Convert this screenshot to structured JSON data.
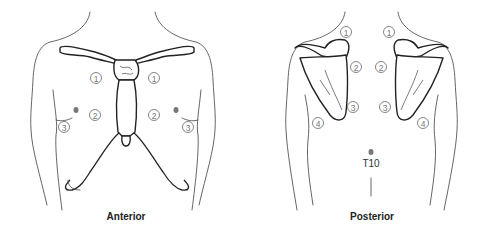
{
  "figure": {
    "panels": [
      {
        "id": "anterior",
        "caption": "Anterior",
        "markers": [
          {
            "label": "1",
            "x": 96,
            "y": 78
          },
          {
            "label": "1",
            "x": 154,
            "y": 78
          },
          {
            "label": "2",
            "x": 95,
            "y": 115
          },
          {
            "label": "2",
            "x": 154,
            "y": 115
          },
          {
            "label": "3",
            "x": 64,
            "y": 127
          },
          {
            "label": "3",
            "x": 188,
            "y": 127
          }
        ],
        "dots": [
          {
            "x": 76,
            "y": 110
          },
          {
            "x": 176,
            "y": 110
          }
        ]
      },
      {
        "id": "posterior",
        "caption": "Posterior",
        "markers": [
          {
            "label": "1",
            "x": 346,
            "y": 32
          },
          {
            "label": "1",
            "x": 389,
            "y": 32
          },
          {
            "label": "2",
            "x": 356,
            "y": 67
          },
          {
            "label": "2",
            "x": 381,
            "y": 67
          },
          {
            "label": "3",
            "x": 353,
            "y": 107
          },
          {
            "label": "3",
            "x": 385,
            "y": 107
          },
          {
            "label": "4",
            "x": 318,
            "y": 123
          },
          {
            "label": "4",
            "x": 423,
            "y": 123
          }
        ],
        "dots": [
          {
            "x": 371,
            "y": 152
          }
        ],
        "landmark_label": "T10"
      }
    ],
    "colors": {
      "outline": "#555555",
      "bone": "#222222",
      "marker": "#777777"
    }
  }
}
